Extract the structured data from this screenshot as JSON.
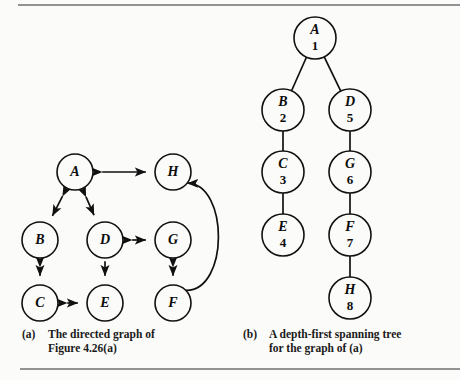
{
  "figure": {
    "background": "#fbfbf9",
    "ink": "#111111",
    "rule_color": "#6f6f6f",
    "rules": [
      {
        "name": "top-rule",
        "x1": 18,
        "y1": 5,
        "x2": 460,
        "y2": 5
      },
      {
        "name": "bottom-rule",
        "x1": 20,
        "y1": 369,
        "x2": 460,
        "y2": 369
      }
    ]
  },
  "panel_a": {
    "caption_tag": "(a)",
    "caption_line1": "The directed graph of",
    "caption_line2": "Figure 4.26(a)",
    "nodes": [
      {
        "id": "A",
        "label": "A",
        "cx": 75,
        "cy": 172,
        "r": 18
      },
      {
        "id": "B",
        "label": "B",
        "cx": 40,
        "cy": 240,
        "r": 18
      },
      {
        "id": "C",
        "label": "C",
        "cx": 40,
        "cy": 303,
        "r": 18
      },
      {
        "id": "D",
        "label": "D",
        "cx": 105,
        "cy": 240,
        "r": 18
      },
      {
        "id": "E",
        "label": "E",
        "cx": 105,
        "cy": 303,
        "r": 18
      },
      {
        "id": "G",
        "label": "G",
        "cx": 173,
        "cy": 240,
        "r": 18
      },
      {
        "id": "F",
        "label": "F",
        "cx": 173,
        "cy": 303,
        "r": 18
      },
      {
        "id": "H",
        "label": "H",
        "cx": 173,
        "cy": 172,
        "r": 18
      }
    ],
    "edges": [
      {
        "from": "A",
        "to": "H",
        "arrows": "both",
        "shape": "straight"
      },
      {
        "from": "A",
        "to": "B",
        "arrows": "both",
        "shape": "straight"
      },
      {
        "from": "A",
        "to": "D",
        "arrows": "both",
        "shape": "straight"
      },
      {
        "from": "B",
        "to": "C",
        "arrows": "both",
        "shape": "straight"
      },
      {
        "from": "D",
        "to": "E",
        "arrows": "forward",
        "shape": "straight"
      },
      {
        "from": "C",
        "to": "E",
        "arrows": "both",
        "shape": "straight"
      },
      {
        "from": "D",
        "to": "G",
        "arrows": "both",
        "shape": "straight"
      },
      {
        "from": "G",
        "to": "F",
        "arrows": "both",
        "shape": "straight"
      },
      {
        "from": "F",
        "to": "H",
        "arrows": "both",
        "shape": "curved-right"
      }
    ]
  },
  "panel_b": {
    "caption_tag": "(b)",
    "caption_line1": "A depth-first spanning tree",
    "caption_line2": "for the graph of (a)",
    "nodes": [
      {
        "id": "A",
        "label": "A",
        "number": "1",
        "cx": 315,
        "cy": 38,
        "r": 21
      },
      {
        "id": "B",
        "label": "B",
        "number": "2",
        "cx": 283,
        "cy": 110,
        "r": 21
      },
      {
        "id": "C",
        "label": "C",
        "number": "3",
        "cx": 283,
        "cy": 172,
        "r": 21
      },
      {
        "id": "E",
        "label": "E",
        "number": "4",
        "cx": 283,
        "cy": 235,
        "r": 21
      },
      {
        "id": "D",
        "label": "D",
        "number": "5",
        "cx": 350,
        "cy": 110,
        "r": 21
      },
      {
        "id": "G",
        "label": "G",
        "number": "6",
        "cx": 350,
        "cy": 172,
        "r": 21
      },
      {
        "id": "F",
        "label": "F",
        "number": "7",
        "cx": 350,
        "cy": 235,
        "r": 21
      },
      {
        "id": "H",
        "label": "H",
        "number": "8",
        "cx": 350,
        "cy": 298,
        "r": 21
      }
    ],
    "edges": [
      {
        "from": "A",
        "to": "B"
      },
      {
        "from": "A",
        "to": "D"
      },
      {
        "from": "B",
        "to": "C"
      },
      {
        "from": "C",
        "to": "E"
      },
      {
        "from": "D",
        "to": "G"
      },
      {
        "from": "G",
        "to": "F"
      },
      {
        "from": "F",
        "to": "H"
      }
    ]
  }
}
